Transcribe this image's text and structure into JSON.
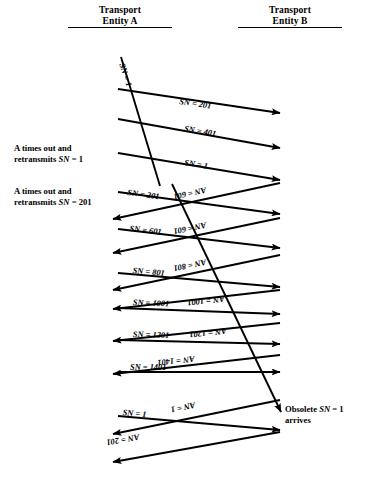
{
  "diagram": {
    "type": "sequence-diagram",
    "headers": {
      "left": {
        "line1": "Transport",
        "line2": "Entity A"
      },
      "right": {
        "line1": "Transport",
        "line2": "Entity B"
      }
    },
    "notes": [
      {
        "id": "note-1",
        "line1": "A times out and",
        "line2": "retransmits SN = 1",
        "x": 14,
        "y": 143
      },
      {
        "id": "note-2",
        "line1": "A times out and",
        "line2": "retransmits SN = 201",
        "x": 14,
        "y": 186
      }
    ],
    "side_notes": [
      {
        "id": "obsolete-note",
        "line1": "Obsolete SN = 1",
        "line2": "arrives",
        "x": 285,
        "y": 404
      }
    ],
    "geometry": {
      "left_x": 118,
      "right_x": 280,
      "arrow_rows": 14
    },
    "messages": [
      {
        "id": "m1",
        "label": "SN = 201",
        "dir": "right",
        "x1": 118,
        "y1": 89,
        "x2": 280,
        "y2": 113,
        "lx": 180,
        "ly": 97
      },
      {
        "id": "m2",
        "label": "SN = 401",
        "dir": "right",
        "x1": 118,
        "y1": 119,
        "x2": 280,
        "y2": 148,
        "lx": 185,
        "ly": 124
      },
      {
        "id": "m3",
        "label": "SN = 1",
        "dir": "right",
        "x1": 118,
        "y1": 153,
        "x2": 280,
        "y2": 180,
        "lx": 185,
        "ly": 158
      },
      {
        "id": "m4",
        "label": "SN = 201",
        "dir": "right",
        "x1": 118,
        "y1": 192,
        "x2": 280,
        "y2": 214,
        "lx": 128,
        "ly": 188
      },
      {
        "id": "m5",
        "label": "AN = 601",
        "dir": "left",
        "x1": 280,
        "y1": 183,
        "x2": 113,
        "y2": 219,
        "lx": 207,
        "ly": 194
      },
      {
        "id": "m6",
        "label": "SN = 601",
        "dir": "right",
        "x1": 118,
        "y1": 229,
        "x2": 280,
        "y2": 248,
        "lx": 130,
        "ly": 224
      },
      {
        "id": "m7",
        "label": "AN = 601",
        "dir": "left",
        "x1": 280,
        "y1": 218,
        "x2": 113,
        "y2": 253,
        "lx": 207,
        "ly": 229
      },
      {
        "id": "m8",
        "label": "SN = 801",
        "dir": "right",
        "x1": 118,
        "y1": 273,
        "x2": 280,
        "y2": 287,
        "lx": 133,
        "ly": 266
      },
      {
        "id": "m9",
        "label": "AN = 801",
        "dir": "left",
        "x1": 280,
        "y1": 255,
        "x2": 113,
        "y2": 290,
        "lx": 207,
        "ly": 266
      },
      {
        "id": "m10",
        "label": "SN = 1001",
        "dir": "right",
        "x1": 118,
        "y1": 308,
        "x2": 280,
        "y2": 314,
        "lx": 133,
        "ly": 298
      },
      {
        "id": "m11",
        "label": "AN = 1001",
        "dir": "left",
        "x1": 280,
        "y1": 290,
        "x2": 113,
        "y2": 309,
        "lx": 225,
        "ly": 303
      },
      {
        "id": "m12",
        "label": "SN = 1201",
        "dir": "right",
        "x1": 118,
        "y1": 340,
        "x2": 280,
        "y2": 344,
        "lx": 133,
        "ly": 330
      },
      {
        "id": "m13",
        "label": "AN = 1201",
        "dir": "left",
        "x1": 280,
        "y1": 323,
        "x2": 113,
        "y2": 341,
        "lx": 227,
        "ly": 335
      },
      {
        "id": "m14",
        "label": "SN = 1401",
        "dir": "right",
        "x1": 118,
        "y1": 372,
        "x2": 280,
        "y2": 372,
        "lx": 130,
        "ly": 363
      },
      {
        "id": "m15",
        "label": "AN = 1401",
        "dir": "left",
        "x1": 280,
        "y1": 355,
        "x2": 113,
        "y2": 374,
        "lx": 195,
        "ly": 363
      },
      {
        "id": "m16",
        "label": "SN = 1",
        "dir": "right",
        "x1": 118,
        "y1": 416,
        "x2": 280,
        "y2": 430,
        "lx": 123,
        "ly": 408
      },
      {
        "id": "m17",
        "label": "AN = 1",
        "dir": "left",
        "x1": 280,
        "y1": 400,
        "x2": 113,
        "y2": 434,
        "lx": 196,
        "ly": 409
      },
      {
        "id": "m18",
        "label": "AN = 201",
        "dir": "left",
        "x1": 280,
        "y1": 432,
        "x2": 113,
        "y2": 462,
        "lx": 140,
        "ly": 441
      }
    ],
    "retransmit_lines": [
      {
        "id": "r1",
        "label": "SN = 1",
        "x1": 121,
        "y1": 57,
        "x2": 160,
        "y2": 186,
        "lx": 126,
        "ly": 62,
        "rot": 72
      },
      {
        "id": "r2",
        "label": "",
        "x1": 172,
        "y1": 184,
        "x2": 281,
        "y2": 412,
        "lx": 0,
        "ly": 0,
        "rot": 0
      }
    ]
  }
}
